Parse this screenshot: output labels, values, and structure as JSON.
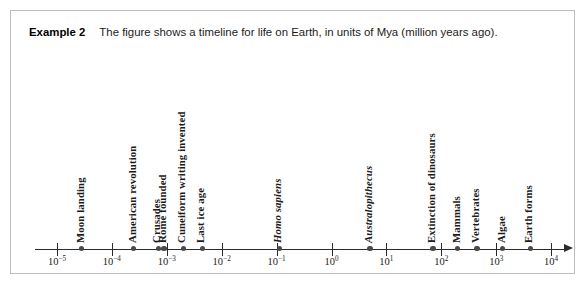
{
  "caption": {
    "example_label": "Example 2",
    "text": "The figure shows a timeline for life on Earth, in units of Mya (million years ago)."
  },
  "chart_data": {
    "type": "scatter",
    "title": "Timeline for life on Earth",
    "xlabel": "Mya (million years ago)",
    "ylabel": "",
    "scale": "log10",
    "xlim": [
      -5,
      4
    ],
    "grid": false,
    "legend": "none",
    "axis_ticks": [
      {
        "exponent": "-5",
        "base": "10",
        "value": 1e-05,
        "label": "10⁻⁵"
      },
      {
        "exponent": "-4",
        "base": "10",
        "value": 0.0001,
        "label": "10⁻⁴"
      },
      {
        "exponent": "-3",
        "base": "10",
        "value": 0.001,
        "label": "10⁻³"
      },
      {
        "exponent": "-2",
        "base": "10",
        "value": 0.01,
        "label": "10⁻²"
      },
      {
        "exponent": "-1",
        "base": "10",
        "value": 0.1,
        "label": "10⁻¹"
      },
      {
        "exponent": "0",
        "base": "10",
        "value": 1,
        "label": "10⁰"
      },
      {
        "exponent": "1",
        "base": "10",
        "value": 10,
        "label": "10¹"
      },
      {
        "exponent": "2",
        "base": "10",
        "value": 100,
        "label": "10²"
      },
      {
        "exponent": "3",
        "base": "10",
        "value": 1000,
        "label": "10³"
      },
      {
        "exponent": "4",
        "base": "10",
        "value": 10000,
        "label": "10⁴"
      }
    ],
    "events": [
      {
        "label": "Moon landing",
        "log_value": -4.55,
        "italic": false
      },
      {
        "label": "American revolution",
        "log_value": -3.6,
        "italic": false
      },
      {
        "label": "Crusades",
        "log_value": -3.15,
        "italic": false
      },
      {
        "label": "Rome founded",
        "log_value": -3.05,
        "italic": false
      },
      {
        "label": "Cuneiform writing invented",
        "log_value": -2.7,
        "italic": false
      },
      {
        "label": "Last ice age",
        "log_value": -2.35,
        "italic": false
      },
      {
        "label": "Homo sapiens",
        "log_value": -0.95,
        "italic": true
      },
      {
        "label": "Australopithecus",
        "log_value": 0.7,
        "italic": true
      },
      {
        "label": "Extinction of dinosaurs",
        "log_value": 1.85,
        "italic": false
      },
      {
        "label": "Mammals",
        "log_value": 2.3,
        "italic": false
      },
      {
        "label": "Vertebrates",
        "log_value": 2.65,
        "italic": false
      },
      {
        "label": "Algae",
        "log_value": 3.12,
        "italic": false
      },
      {
        "label": "Earth forms",
        "log_value": 3.62,
        "italic": false
      }
    ]
  },
  "colors": {
    "border": "#b9bcc0",
    "axis": "#2b2b2b",
    "dot": "#4a4a4a",
    "text": "#1b1b1b",
    "background": "#ffffff"
  }
}
